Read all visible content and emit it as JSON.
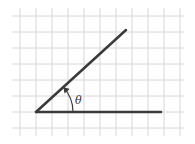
{
  "diagram": {
    "type": "angle-on-grid",
    "angle_label": "θ",
    "grid": {
      "x_lines": [
        20,
        36,
        52,
        68,
        84,
        100,
        116,
        132,
        148,
        164,
        180
      ],
      "y_lines": [
        16,
        32,
        48,
        64,
        80,
        96,
        112,
        128
      ],
      "x_range": [
        12,
        184
      ],
      "y_range": [
        8,
        136
      ],
      "color": "#d6d6d6"
    },
    "vertex": [
      36,
      112
    ],
    "horizontal_ray_end": [
      161,
      112
    ],
    "diagonal_ray_end": [
      126,
      30
    ],
    "line_color": "#3a3a3a"
  }
}
